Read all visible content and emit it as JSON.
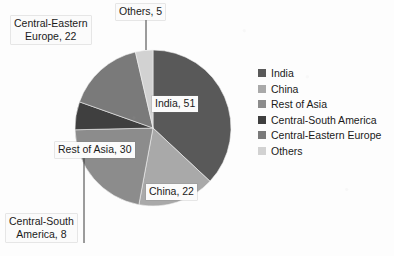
{
  "chart_data": {
    "type": "pie",
    "title": "",
    "categories": [
      "India",
      "China",
      "Rest of Asia",
      "Central-South America",
      "Central-Eastern Europe",
      "Others"
    ],
    "values": [
      51,
      22,
      30,
      8,
      22,
      5
    ],
    "total": 138,
    "legend_position": "right",
    "grid": false,
    "data_labels": [
      "India, 51",
      "China, 22",
      "Rest of Asia, 30",
      "Central-South\nAmerica, 8",
      "Central-Eastern\nEurope, 22",
      "Others, 5"
    ],
    "colors": [
      "#595959",
      "#a9a9a9",
      "#8c8c8c",
      "#3f3f3f",
      "#7a7a7a",
      "#d2d2d2"
    ]
  },
  "legend": {
    "items": [
      {
        "label": "India",
        "color": "#595959"
      },
      {
        "label": "China",
        "color": "#a9a9a9"
      },
      {
        "label": "Rest of Asia",
        "color": "#8c8c8c"
      },
      {
        "label": "Central-South America",
        "color": "#3f3f3f"
      },
      {
        "label": "Central-Eastern Europe",
        "color": "#7a7a7a"
      },
      {
        "label": "Others",
        "color": "#d2d2d2"
      }
    ]
  },
  "labels": {
    "india": "India, 51",
    "china": "China, 22",
    "rest_of_asia": "Rest of Asia, 30",
    "central_south_america": "Central-South\nAmerica, 8",
    "central_eastern_europe": "Central-Eastern\nEurope, 22",
    "others": "Others, 5"
  }
}
